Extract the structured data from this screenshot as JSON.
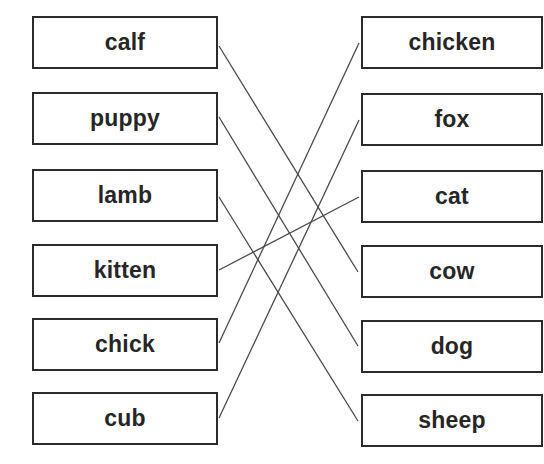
{
  "diagram": {
    "type": "matching-exercise",
    "left_column": [
      {
        "label": "calf",
        "top": 16
      },
      {
        "label": "puppy",
        "top": 92
      },
      {
        "label": "lamb",
        "top": 169
      },
      {
        "label": "kitten",
        "top": 244
      },
      {
        "label": "chick",
        "top": 318
      },
      {
        "label": "cub",
        "top": 392
      }
    ],
    "right_column": [
      {
        "label": "chicken",
        "top": 16
      },
      {
        "label": "fox",
        "top": 93
      },
      {
        "label": "cat",
        "top": 170
      },
      {
        "label": "cow",
        "top": 245
      },
      {
        "label": "dog",
        "top": 320
      },
      {
        "label": "sheep",
        "top": 394
      }
    ],
    "connections": [
      {
        "from": "calf",
        "to": "cow"
      },
      {
        "from": "puppy",
        "to": "dog"
      },
      {
        "from": "lamb",
        "to": "sheep"
      },
      {
        "from": "kitten",
        "to": "cat"
      },
      {
        "from": "chick",
        "to": "chicken"
      },
      {
        "from": "cub",
        "to": "fox"
      }
    ],
    "line_color": "#4a4a4a",
    "box_border_color": "#2b2b2b"
  }
}
